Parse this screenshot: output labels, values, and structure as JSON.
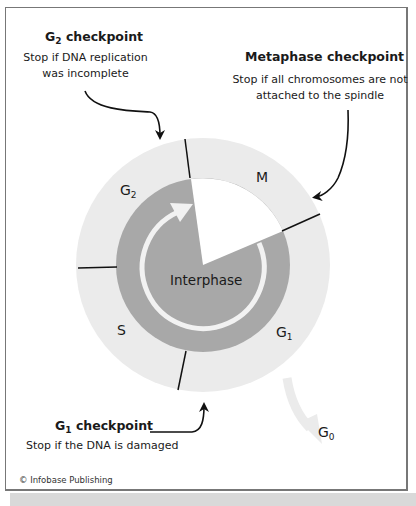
{
  "colors": {
    "outer_ring": "#ebebeb",
    "interphase_disc": "#a8a8a8",
    "mitosis_wedge": "#ffffff",
    "cycle_arrow": "#f2f2f2",
    "checkpoint_arrow": "#111111",
    "divider": "#111111"
  },
  "diagram": {
    "center_label": "Interphase",
    "phases": [
      {
        "id": "M",
        "label": "M",
        "sub": ""
      },
      {
        "id": "G1",
        "label": "G",
        "sub": "1"
      },
      {
        "id": "S",
        "label": "S",
        "sub": ""
      },
      {
        "id": "G2",
        "label": "G",
        "sub": "2"
      }
    ],
    "exit_phase": {
      "label": "G",
      "sub": "0"
    }
  },
  "checkpoints": {
    "g2": {
      "title_main": "G",
      "title_sub": "2",
      "title_rest": " checkpoint",
      "line1": "Stop if DNA replication",
      "line2": "was incomplete"
    },
    "metaphase": {
      "title": "Metaphase checkpoint",
      "line1": "Stop if all chromosomes are not",
      "line2": "attached to the spindle"
    },
    "g1": {
      "title_main": "G",
      "title_sub": "1",
      "title_rest": " checkpoint",
      "line1": "Stop if the DNA is damaged"
    }
  },
  "credit": "© Infobase Publishing"
}
